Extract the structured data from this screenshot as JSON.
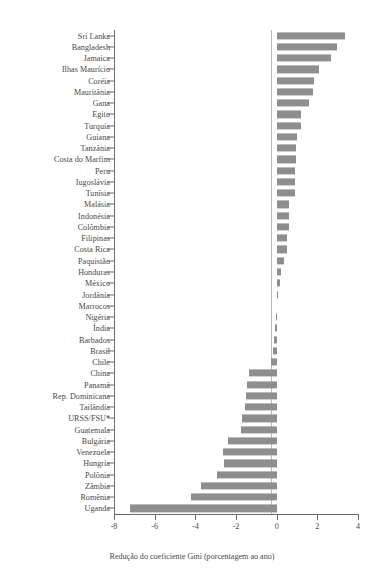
{
  "chart_data": {
    "type": "bar",
    "orientation": "horizontal",
    "title": "",
    "subtitle": "",
    "xlabel": "Redução do coeficiente Gini (porcentagem ao ano)",
    "ylabel": "",
    "xlim": [
      -8,
      4
    ],
    "ylim": null,
    "grid": false,
    "legend": null,
    "bar_color": "#8e8e8e",
    "axis_color": "#6d6a67",
    "zero_line_color": "#b9b9b9",
    "xticks": [
      -8,
      -6,
      -4,
      -2,
      0,
      2,
      4
    ],
    "xticklabels": [
      "-8",
      "-6",
      "-4",
      "-2",
      "0",
      "2",
      "4"
    ],
    "categories": [
      "Sri Lanka",
      "Bangladesh",
      "Jamaica",
      "Ilhas Maurício",
      "Coréia",
      "Mauritânia",
      "Gana",
      "Egito",
      "Turquia",
      "Guiana",
      "Tanzânia",
      "Costa do Marfim",
      "Peru",
      "Iugoslávia",
      "Tunísia",
      "Malásia",
      "Indonésia",
      "Colômbia",
      "Filipinas",
      "Costa Rica",
      "Paquistão",
      "Honduras",
      "México",
      "Jordânia",
      "Marrocos",
      "Nigéria",
      "Índia",
      "Barbados",
      "Brasil",
      "Chile",
      "China",
      "Panamá",
      "Rep. Dominicana",
      "Tailândia",
      "URSS/FSU*",
      "Guatemala",
      "Bulgária",
      "Venezuela",
      "Hungria",
      "Polônia",
      "Zâmbia",
      "Romênia",
      "Uganda"
    ],
    "values": [
      3.35,
      2.95,
      2.65,
      2.1,
      1.85,
      1.8,
      1.6,
      1.2,
      1.2,
      1.0,
      0.97,
      0.95,
      0.9,
      0.88,
      0.88,
      0.62,
      0.6,
      0.62,
      0.5,
      0.5,
      0.35,
      0.2,
      0.15,
      0.05,
      0.0,
      -0.05,
      -0.08,
      -0.15,
      -0.2,
      -0.3,
      -1.35,
      -1.45,
      -1.5,
      -1.55,
      -1.7,
      -1.75,
      -2.4,
      -2.65,
      -2.6,
      -2.95,
      -3.7,
      -4.2,
      -7.2
    ],
    "footnote": "URSS/FSU*"
  }
}
